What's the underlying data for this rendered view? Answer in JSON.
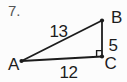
{
  "problem": {
    "number": "7."
  },
  "diagram": {
    "type": "right-triangle",
    "vertices": [
      {
        "label": "A",
        "position": "bottom-left"
      },
      {
        "label": "B",
        "position": "top-right"
      },
      {
        "label": "C",
        "position": "bottom-right"
      }
    ],
    "sides": [
      {
        "label": "13",
        "between": "A-B",
        "role": "hypotenuse"
      },
      {
        "label": "12",
        "between": "A-C",
        "role": "base"
      },
      {
        "label": "5",
        "between": "B-C",
        "role": "vertical-leg"
      }
    ],
    "right_angle_at": "C",
    "colors": {
      "line": "#1c1c1c",
      "label": "#1c1c1c",
      "problem_number": "#555555",
      "background": "#fcfcfc"
    }
  }
}
